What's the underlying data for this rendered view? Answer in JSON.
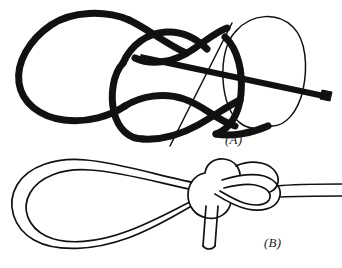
{
  "figure": {
    "type": "line-drawing",
    "background_color": "#ffffff",
    "ink_color": "#111111",
    "panels": [
      {
        "id": "A",
        "label": "(A)",
        "caption_position": "bottom-right",
        "description": "Schematic crossing diagram of the knot drawn with a thick bold cord, a thin continuation cord on the right, and a thin straight working line passing diagonally through the crossings; the free end is cut square at the right.",
        "elements": [
          "thick-left-bight",
          "thick-center-loop",
          "thick-upper-crossing",
          "thick-lower-crossing",
          "thin-right-loop",
          "thin-diagonal-working-line",
          "cut-rope-end"
        ]
      },
      {
        "id": "B",
        "label": "(B)",
        "caption_position": "bottom-right",
        "description": "The completed bowline: a large fixed loop on the left drawn as a double outline, the knot nub at the right with interlocking turns, the standing part running off to the right edge, and the short tail hanging down with a square cut end.",
        "elements": [
          "fixed-loop",
          "knot-collar",
          "knot-turns",
          "standing-part",
          "short-tail",
          "tail-cut-end"
        ]
      }
    ]
  },
  "labels": {
    "panel_a": "(A)",
    "panel_b": "(B)"
  },
  "style": {
    "stroke_color": "#111111",
    "fill_color": "#ffffff",
    "thick_cord_width": 7,
    "thin_cord_width": 1.4,
    "outline_width": 1.6
  }
}
